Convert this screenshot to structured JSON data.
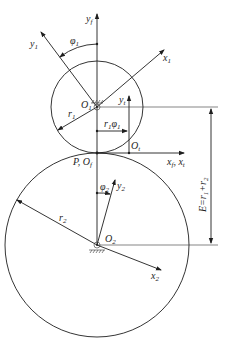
{
  "diagram": {
    "labels": {
      "yf": "y",
      "yf_sub": "f",
      "y1": "y",
      "y1_sub": "1",
      "x1": "x",
      "x1_sub": "1",
      "phi1": "φ",
      "phi1_sub": "1",
      "O1": "O",
      "O1_sub": "1",
      "r1": "r",
      "r1_sub": "1",
      "yt": "y",
      "yt_sub": "t",
      "r1phi1": "r",
      "r1phi1_sub": "1",
      "r1phi1_phi": "φ",
      "r1phi1_phi_sub": "1",
      "Ot": "O",
      "Ot_sub": "t",
      "P_Of": "P, O",
      "P_Of_sub": "f",
      "xf_xt": "x",
      "xf_sub": "f",
      "xt_sep": ", x",
      "xt_sub": "t",
      "E": "E=r",
      "E_sub1": "1",
      "E_plus": "+r",
      "E_sub2": "2",
      "phi2": "φ",
      "phi2_sub": "2",
      "y2": "y",
      "y2_sub": "2",
      "r2": "r",
      "r2_sub": "2",
      "O2": "O",
      "O2_sub": "2",
      "x2": "x",
      "x2_sub": "2"
    },
    "colors": {
      "line": "#1e1e1e",
      "background": "#ffffff"
    }
  }
}
